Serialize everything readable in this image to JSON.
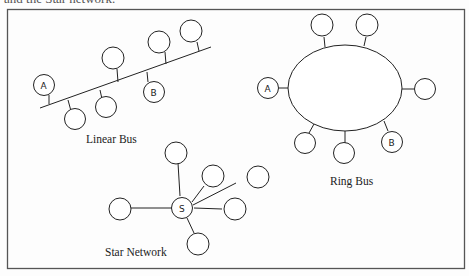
{
  "caption_top": "and the Star network.",
  "diagrams": {
    "linear_bus": {
      "title": "Linear Bus",
      "nodes": [
        {
          "label": "A"
        },
        {
          "label": ""
        },
        {
          "label": ""
        },
        {
          "label": ""
        },
        {
          "label": "B"
        },
        {
          "label": ""
        },
        {
          "label": ""
        }
      ]
    },
    "ring_bus": {
      "title": "Ring Bus",
      "nodes": [
        {
          "label": "A"
        },
        {
          "label": ""
        },
        {
          "label": ""
        },
        {
          "label": ""
        },
        {
          "label": ""
        },
        {
          "label": ""
        },
        {
          "label": "B"
        }
      ]
    },
    "star_network": {
      "title": "Star Network",
      "hub": {
        "label": "S"
      },
      "nodes": [
        {
          "label": ""
        },
        {
          "label": ""
        },
        {
          "label": ""
        },
        {
          "label": ""
        },
        {
          "label": ""
        },
        {
          "label": ""
        }
      ]
    }
  },
  "colors": {
    "stroke": "#222222",
    "frame": "#555555",
    "background": "#fdfdfd"
  }
}
